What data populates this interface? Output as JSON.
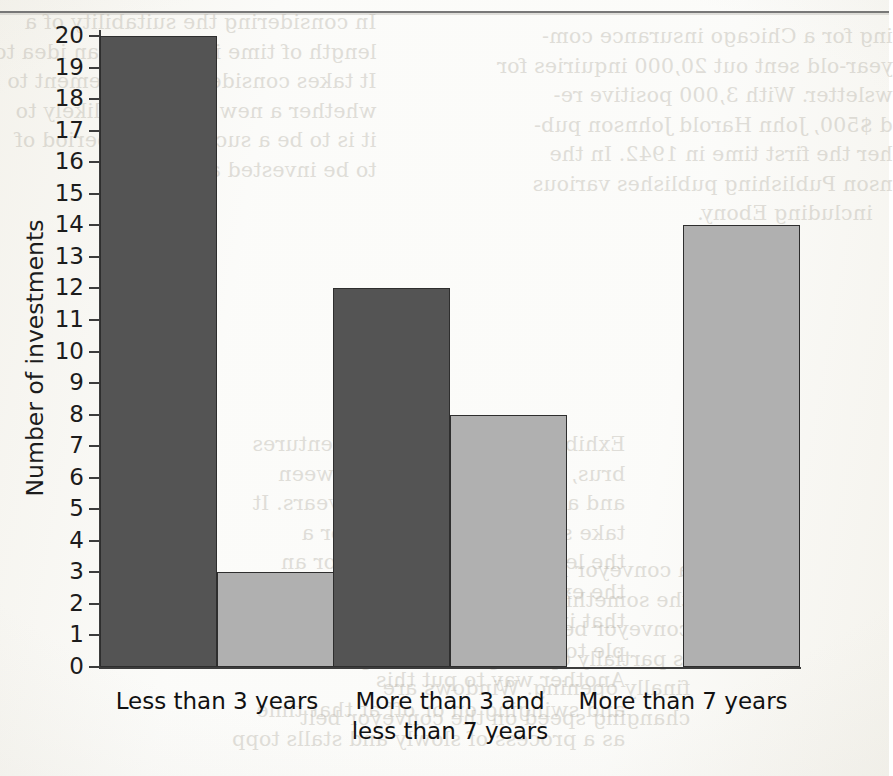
{
  "page": {
    "background_color": "#fbfbf9",
    "rule_color": "#6d6d6d",
    "bleed_text_right": "ing for a Chicago insurance com-\nyear-old sent out 20,000 inquiries for\nwsletter. With 3,000 positive re-\nd $500, John Harold Johnson pub-\nher the first time in 1942. In the\nnson Publishing publishes various\n   including Ebony.",
    "bleed_text_left": "In considering the suitability of a\nlength of time it takes for an idea to\nIt takes considerable judgement to\nwhether a new venture is likely to\nit is to be a success. The period of\nto be invested and",
    "bleed_text_mid": "Exhibit 5.7 shows that for ventures\nbrus, the length of time between\nand a half years and three years. It\ntake seven or eight years for a\nthe length of time it takes for an\nthe expert noted that more than half\nthat invested in ventures were\nple to realize a return. Another way\nAnother way to put this\nand swinging on or off at that time\nas a process of slowly and stalls topp",
    "bleed_text_lower": "a conveyor belt. The belt is in\nthe something that moves very\nconveyor belt, and the new window\nis partially opening and closing\nfinally opening. Windows are\nchanging speed on the conveyor belt"
  },
  "chart_data": {
    "type": "bar",
    "title": "",
    "xlabel": "",
    "ylabel": "Number of investments",
    "categories": [
      "Less than 3 years",
      "More than 3 and\nless than 7 years",
      "More than 7 years"
    ],
    "series": [
      {
        "name": "dark-series",
        "color": "#545454",
        "values": [
          20,
          12,
          null
        ]
      },
      {
        "name": "light-series",
        "color": "#b0b0b0",
        "values": [
          3,
          8,
          14
        ]
      }
    ],
    "ylim": [
      0,
      20
    ],
    "yticks": [
      0,
      1,
      2,
      3,
      4,
      5,
      6,
      7,
      8,
      9,
      10,
      11,
      12,
      13,
      14,
      15,
      16,
      17,
      18,
      19,
      20
    ],
    "grid": false,
    "legend": "none"
  }
}
